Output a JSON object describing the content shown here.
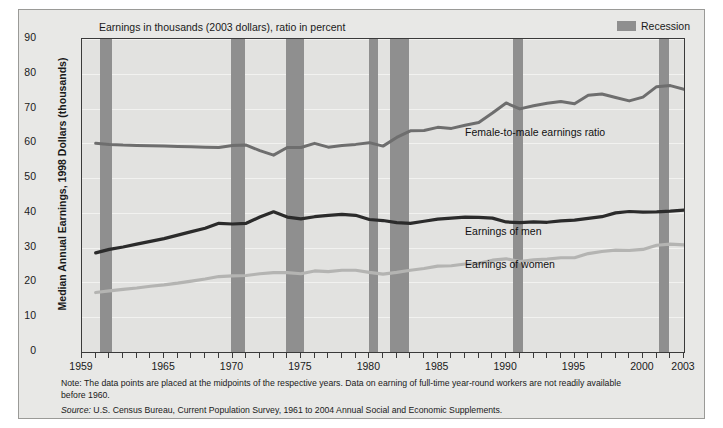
{
  "chart_data": {
    "type": "line",
    "title": "Earnings in thousands (2003 dollars), ratio in percent",
    "xlabel": "",
    "ylabel": "Median Annual Earnings, 1998 Dollars (thousands)",
    "xlim": [
      1959,
      2003
    ],
    "ylim": [
      0,
      90
    ],
    "grid": true,
    "legend_position": "top-right",
    "x": [
      1960,
      1961,
      1962,
      1963,
      1964,
      1965,
      1966,
      1967,
      1968,
      1969,
      1970,
      1971,
      1972,
      1973,
      1974,
      1975,
      1976,
      1977,
      1978,
      1979,
      1980,
      1981,
      1982,
      1983,
      1984,
      1985,
      1986,
      1987,
      1988,
      1989,
      1990,
      1991,
      1992,
      1993,
      1994,
      1995,
      1996,
      1997,
      1998,
      1999,
      2000,
      2001,
      2002,
      2003
    ],
    "series": [
      {
        "name": "Female-to-male earnings ratio",
        "color": "#6e6e6e",
        "values": [
          60.0,
          59.7,
          59.5,
          59.4,
          59.3,
          59.2,
          59.1,
          59.0,
          58.9,
          58.8,
          59.4,
          59.5,
          57.9,
          56.6,
          58.8,
          58.8,
          60.0,
          58.9,
          59.4,
          59.7,
          60.2,
          59.2,
          61.7,
          63.6,
          63.7,
          64.6,
          64.3,
          65.2,
          66.0,
          68.7,
          71.6,
          69.9,
          70.8,
          71.5,
          72.0,
          71.4,
          73.8,
          74.2,
          73.2,
          72.2,
          73.3,
          76.3,
          76.6,
          75.5
        ]
      },
      {
        "name": "Earnings of men",
        "color": "#2b2b2b",
        "values": [
          28.5,
          29.5,
          30.2,
          31.0,
          31.8,
          32.6,
          33.6,
          34.6,
          35.6,
          37.0,
          36.8,
          37.0,
          38.8,
          40.3,
          38.8,
          38.3,
          38.9,
          39.3,
          39.6,
          39.3,
          38.1,
          37.8,
          37.2,
          37.0,
          37.6,
          38.2,
          38.5,
          38.8,
          38.7,
          38.5,
          37.4,
          37.2,
          37.4,
          37.3,
          37.7,
          37.9,
          38.4,
          38.9,
          40.0,
          40.4,
          40.2,
          40.3,
          40.5,
          40.8
        ]
      },
      {
        "name": "Earnings of women",
        "color": "#b4b4b2",
        "values": [
          17.1,
          17.6,
          18.0,
          18.4,
          18.9,
          19.3,
          19.8,
          20.4,
          21.0,
          21.7,
          21.9,
          22.0,
          22.5,
          22.8,
          22.8,
          22.5,
          23.3,
          23.1,
          23.5,
          23.5,
          22.9,
          22.4,
          22.9,
          23.5,
          24.0,
          24.7,
          24.8,
          25.3,
          25.5,
          26.4,
          26.8,
          26.0,
          26.5,
          26.7,
          27.1,
          27.1,
          28.3,
          28.9,
          29.3,
          29.2,
          29.5,
          30.7,
          31.0,
          30.8
        ]
      }
    ],
    "recessions": [
      {
        "start": 1960.3,
        "end": 1961.2
      },
      {
        "start": 1969.9,
        "end": 1970.9
      },
      {
        "start": 1973.9,
        "end": 1975.2
      },
      {
        "start": 1980.0,
        "end": 1980.6
      },
      {
        "start": 1981.5,
        "end": 1982.9
      },
      {
        "start": 1990.5,
        "end": 1991.2
      },
      {
        "start": 2001.2,
        "end": 2001.9
      }
    ],
    "yticks": [
      0,
      10,
      20,
      30,
      40,
      50,
      60,
      70,
      80,
      90
    ],
    "xticks": [
      1959,
      1965,
      1970,
      1975,
      1980,
      1985,
      1990,
      1995,
      2000,
      2003
    ],
    "annotations": [
      {
        "text": "Female-to-male earnings ratio",
        "x": 1987.0,
        "y": 63.0
      },
      {
        "text": "Earnings of men",
        "x": 1987.0,
        "y": 34.5
      },
      {
        "text": "Earnings of women",
        "x": 1987.0,
        "y": 25.0
      }
    ]
  },
  "legend": {
    "swatch_color": "#8f8f8f",
    "label": "Recession"
  },
  "footnotes": {
    "note": "Note: The data points are placed at the midpoints of the respective years. Data on earning of full-time year-round workers are not readily available before 1960.",
    "source_prefix": "Source:",
    "source_text": " U.S. Census Bureau, Current Population Survey, 1961 to 2004 Annual Social and Economic Supplements."
  }
}
